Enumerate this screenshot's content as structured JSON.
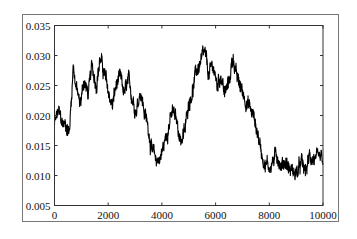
{
  "chart_data": {
    "type": "line",
    "title": "",
    "xlabel": "",
    "ylabel": "",
    "xlim": [
      0,
      10000
    ],
    "ylim": [
      0.005,
      0.035
    ],
    "grid": false,
    "legend": null,
    "x_ticks": [
      0,
      2000,
      4000,
      6000,
      8000,
      10000
    ],
    "x_tick_labels": [
      "0",
      "2000",
      "4000",
      "6000",
      "8000",
      "10000"
    ],
    "y_ticks": [
      0.005,
      0.01,
      0.015,
      0.02,
      0.025,
      0.03,
      0.035
    ],
    "y_tick_labels": [
      "0.005",
      "0.010",
      "0.015",
      "0.020",
      "0.025",
      "0.030",
      "0.035"
    ],
    "line_color": "#000000",
    "series": [
      {
        "name": "series",
        "x": [
          0,
          150,
          300,
          450,
          550,
          700,
          800,
          950,
          1100,
          1250,
          1400,
          1550,
          1700,
          1850,
          2000,
          2150,
          2300,
          2450,
          2600,
          2750,
          2900,
          3050,
          3200,
          3350,
          3500,
          3650,
          3800,
          3950,
          4100,
          4250,
          4400,
          4550,
          4700,
          4850,
          5000,
          5150,
          5300,
          5450,
          5600,
          5750,
          5900,
          6050,
          6200,
          6350,
          6500,
          6650,
          6800,
          6950,
          7100,
          7250,
          7400,
          7550,
          7700,
          7850,
          8000,
          8150,
          8300,
          8450,
          8600,
          8750,
          8900,
          9050,
          9200,
          9350,
          9500,
          9650,
          9800,
          9950,
          10000
        ],
        "y": [
          0.0185,
          0.0205,
          0.0185,
          0.0185,
          0.017,
          0.0285,
          0.025,
          0.0215,
          0.026,
          0.0235,
          0.028,
          0.0255,
          0.0295,
          0.027,
          0.024,
          0.0215,
          0.025,
          0.026,
          0.0235,
          0.0255,
          0.023,
          0.021,
          0.0245,
          0.0205,
          0.018,
          0.0135,
          0.0125,
          0.013,
          0.0155,
          0.0185,
          0.0205,
          0.019,
          0.016,
          0.017,
          0.0225,
          0.0245,
          0.0275,
          0.029,
          0.03,
          0.0265,
          0.0285,
          0.025,
          0.027,
          0.0235,
          0.0255,
          0.03,
          0.026,
          0.0245,
          0.023,
          0.0215,
          0.02,
          0.0175,
          0.014,
          0.012,
          0.0115,
          0.0125,
          0.0135,
          0.0115,
          0.0125,
          0.011,
          0.0105,
          0.0105,
          0.012,
          0.0105,
          0.013,
          0.013,
          0.012,
          0.0125,
          0.012
        ]
      }
    ]
  }
}
